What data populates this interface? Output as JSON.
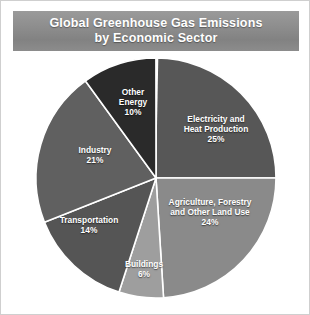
{
  "title": {
    "line1": "Global Greenhouse Gas Emissions",
    "line2": "by Economic Sector"
  },
  "chart_data": {
    "type": "pie",
    "title": "Global Greenhouse Gas Emissions by Economic Sector",
    "xlabel": "",
    "ylabel": "",
    "units": "percent of total emissions",
    "legend_position": "none",
    "labels_on_slices": true,
    "grid": false,
    "start_angle_deg": 0,
    "direction": "clockwise",
    "categories": [
      "Electricity and Heat Production",
      "Agriculture, Forestry and Other Land Use",
      "Buildings",
      "Transportation",
      "Industry",
      "Other Energy"
    ],
    "values": [
      25,
      24,
      6,
      14,
      21,
      10
    ],
    "value_labels": [
      "25%",
      "24%",
      "6%",
      "14%",
      "21%",
      "10%"
    ],
    "colors": [
      "#575757",
      "#8a8a8a",
      "#9e9e9e",
      "#555555",
      "#606060",
      "#2a2a2a"
    ],
    "total": 100,
    "slices": [
      {
        "name": "electricity",
        "label_line1": "Electricity and",
        "label_line2": "Heat Production",
        "percent_label": "25%",
        "value": 25,
        "color": "#575757"
      },
      {
        "name": "agriculture",
        "label_line1": "Agriculture, Forestry",
        "label_line2": "and Other Land Use",
        "percent_label": "24%",
        "value": 24,
        "color": "#8a8a8a"
      },
      {
        "name": "buildings",
        "label_line1": "Buildings",
        "label_line2": "",
        "percent_label": "6%",
        "value": 6,
        "color": "#9e9e9e"
      },
      {
        "name": "transportation",
        "label_line1": "Transportation",
        "label_line2": "",
        "percent_label": "14%",
        "value": 14,
        "color": "#555555"
      },
      {
        "name": "industry",
        "label_line1": "Industry",
        "label_line2": "",
        "percent_label": "21%",
        "value": 21,
        "color": "#606060"
      },
      {
        "name": "other_energy",
        "label_line1": "Other",
        "label_line2": "Energy",
        "percent_label": "10%",
        "value": 10,
        "color": "#2a2a2a"
      }
    ]
  },
  "style": {
    "banner_color": "#8c8c8c",
    "label_color": "#ffffff",
    "separator_color": "#ffffff",
    "background": "#ffffff"
  }
}
